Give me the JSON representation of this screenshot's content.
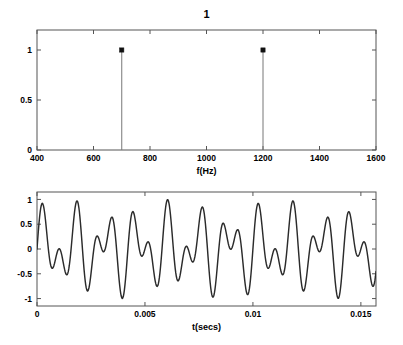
{
  "figure": {
    "background_color": "#ffffff",
    "line_color": "#2b2b2b",
    "axis_color": "#555555",
    "marker_color": "#111111"
  },
  "chart_data": [
    {
      "type": "bar",
      "subplot": "top",
      "title": "1",
      "xlabel": "f(Hz)",
      "ylabel": "",
      "categories": [
        "700",
        "1200"
      ],
      "values": [
        1,
        1
      ],
      "x": [
        700,
        1200
      ],
      "xlim": [
        400,
        1600
      ],
      "ylim": [
        0,
        1.2
      ],
      "xticks": [
        400,
        600,
        800,
        1000,
        1200,
        1400,
        1600
      ],
      "xticklabels": [
        "400",
        "600",
        "800",
        "1000",
        "1200",
        "1400",
        "1600"
      ],
      "yticks": [
        0,
        0.5,
        1
      ],
      "yticklabels": [
        "0",
        "0.5",
        "1"
      ],
      "grid": false,
      "legend": null,
      "style": "stem",
      "marker": "filled-square",
      "description": "Magnitude spectrum with two unit-amplitude spectral lines at 700 Hz and 1200 Hz"
    },
    {
      "type": "line",
      "subplot": "bottom",
      "title": "",
      "xlabel": "t(secs)",
      "ylabel": "",
      "xlim": [
        0,
        0.0157
      ],
      "ylim": [
        -1.15,
        1.15
      ],
      "xticks": [
        0,
        0.005,
        0.01,
        0.015
      ],
      "xticklabels": [
        "0",
        "0.005",
        "0.01",
        "0.015"
      ],
      "yticks": [
        -1,
        -0.5,
        0,
        0.5,
        1
      ],
      "yticklabels": [
        "-1",
        "-0.5",
        "0",
        "0.5",
        "1"
      ],
      "grid": false,
      "legend": null,
      "series": [
        {
          "name": "x(t)",
          "formula": "0.5*sin(2*pi*700*t) + 0.5*sin(2*pi*1200*t)",
          "components": [
            {
              "frequency_hz": 700,
              "amplitude": 0.5
            },
            {
              "frequency_hz": 1200,
              "amplitude": 0.5
            }
          ],
          "samples": 640
        }
      ],
      "description": "Time-domain waveform: sum of a 700 Hz and a 1200 Hz sinusoid showing a beating envelope"
    }
  ]
}
